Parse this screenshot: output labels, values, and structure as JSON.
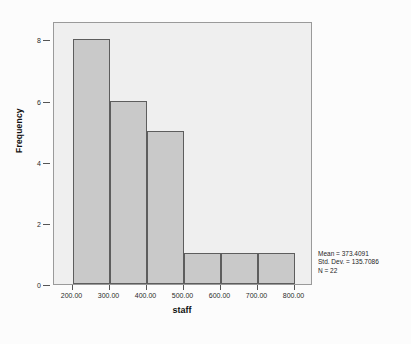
{
  "figure": {
    "background_color": "#fcfcfc",
    "plot_background_color": "#efefef",
    "frame_color": "#9a9a9a"
  },
  "annotations": {
    "mean_line": "Mean = 373.4091",
    "std_dev_line": "Std. Dev. = 135.7086",
    "n_line": "N = 22"
  },
  "chart_data": {
    "type": "bar",
    "subtype": "histogram",
    "title": "",
    "subtitle": "",
    "xlabel": "staff",
    "ylabel": "Frequency",
    "bar_fill_color": "#c9c9c9",
    "bar_border_color": "#5d5d5d",
    "grid": false,
    "legend": false,
    "legend_position": "none",
    "bin_width": 100,
    "xlim": [
      150,
      850
    ],
    "ylim": [
      0,
      8.6
    ],
    "x_tick_labels": [
      "200.00",
      "300.00",
      "400.00",
      "500.00",
      "600.00",
      "700.00",
      "800.00"
    ],
    "x_tick_values": [
      200,
      300,
      400,
      500,
      600,
      700,
      800
    ],
    "y_tick_labels": [
      "0",
      "2",
      "4",
      "6",
      "8"
    ],
    "y_tick_values": [
      0,
      2,
      4,
      6,
      8
    ],
    "categories": [
      "200-300",
      "300-400",
      "400-500",
      "500-600",
      "600-700",
      "700-800"
    ],
    "bin_edges": [
      200,
      300,
      400,
      500,
      600,
      700,
      800
    ],
    "values": [
      8,
      6,
      5,
      1,
      1,
      1
    ],
    "statistics": {
      "mean": 373.4091,
      "std_dev": 135.7086,
      "n": 22
    }
  }
}
